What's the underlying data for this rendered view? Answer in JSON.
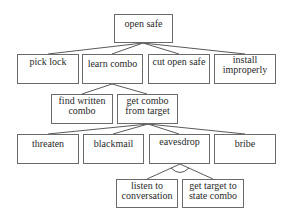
{
  "diagram": {
    "type": "attack-tree",
    "nodes": [
      {
        "id": "root",
        "label": "open safe",
        "box": [
          114,
          14,
          59,
          29
        ]
      },
      {
        "id": "pick_lock",
        "label": "pick lock",
        "parent": "root",
        "box": [
          17,
          54,
          62,
          30
        ]
      },
      {
        "id": "learn_combo",
        "label": "learn combo",
        "parent": "root",
        "box": [
          82,
          54,
          61,
          30
        ]
      },
      {
        "id": "cut_open",
        "label": "cut open safe",
        "parent": "root",
        "box": [
          148,
          54,
          62,
          30
        ]
      },
      {
        "id": "install",
        "label": "install improperly",
        "parent": "root",
        "box": [
          214,
          54,
          62,
          30
        ]
      },
      {
        "id": "find_written",
        "label": "find written combo",
        "parent": "learn_combo",
        "box": [
          51,
          94,
          62,
          30
        ]
      },
      {
        "id": "get_combo",
        "label": "get combo from target",
        "parent": "learn_combo",
        "box": [
          117,
          94,
          61,
          30
        ]
      },
      {
        "id": "threaten",
        "label": "threaten",
        "parent": "get_combo",
        "box": [
          17,
          134,
          62,
          30
        ]
      },
      {
        "id": "blackmail",
        "label": "blackmail",
        "parent": "get_combo",
        "box": [
          83,
          134,
          61,
          30
        ]
      },
      {
        "id": "eavesdrop",
        "label": "eavesdrop",
        "parent": "get_combo",
        "box": [
          149,
          134,
          61,
          30
        ]
      },
      {
        "id": "bribe",
        "label": "bribe",
        "parent": "get_combo",
        "box": [
          214,
          134,
          62,
          30
        ]
      },
      {
        "id": "listen",
        "label": "listen to conversation",
        "parent": "eavesdrop",
        "box": [
          116,
          179,
          62,
          29
        ]
      },
      {
        "id": "state_combo",
        "label": "get target to state combo",
        "parent": "eavesdrop",
        "box": [
          182,
          179,
          62,
          29
        ]
      }
    ],
    "and_nodes": [
      "eavesdrop"
    ],
    "labels": {
      "root": "open safe",
      "pick_lock": "pick lock",
      "learn_combo": "learn combo",
      "cut_open": "cut open safe",
      "install_1": "install",
      "install_2": "improperly",
      "find_written_1": "find written",
      "find_written_2": "combo",
      "get_combo_1": "get combo",
      "get_combo_2": "from target",
      "threaten": "threaten",
      "blackmail": "blackmail",
      "eavesdrop": "eavesdrop",
      "bribe": "bribe",
      "listen_1": "listen to",
      "listen_2": "conversation",
      "state_combo_1": "get target to",
      "state_combo_2": "state combo"
    },
    "colors": {
      "line": "#5a5a5a",
      "border": "#6a6a6a",
      "text": "#2a2a2a",
      "background": "#ffffff"
    }
  }
}
